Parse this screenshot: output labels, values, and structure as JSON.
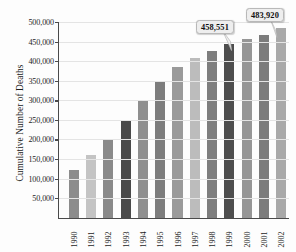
{
  "chart_data": {
    "type": "bar",
    "title": "",
    "subtitle": "",
    "xlabel": "",
    "ylabel": "Cumulative Number of Deaths",
    "categories": [
      "1990",
      "1991",
      "1992",
      "1993",
      "1994",
      "1995",
      "1996",
      "1997",
      "1998",
      "1999",
      "2000",
      "2001",
      "2002"
    ],
    "values": [
      122000,
      160000,
      201000,
      247000,
      298000,
      348000,
      386000,
      409000,
      427000,
      443000,
      457000,
      466000,
      484000
    ],
    "bar_colors": [
      "#8c8c8c",
      "#c4c4c4",
      "#8a8a8a",
      "#4a4a4a",
      "#8f8f8f",
      "#7d7d7d",
      "#9a9a9a",
      "#bcbcbc",
      "#7e7e7e",
      "#4e4e4e",
      "#969696",
      "#7c7c7c",
      "#a9a9a9"
    ],
    "ylim": [
      0,
      500000
    ],
    "y_ticks": [
      50000,
      100000,
      150000,
      200000,
      250000,
      300000,
      350000,
      400000,
      450000,
      500000
    ],
    "y_tick_labels": [
      "50,000",
      "100,000",
      "150,000",
      "200,000",
      "250,000",
      "300,000",
      "350,000",
      "400,000",
      "450,000",
      "500,000"
    ],
    "grid": true,
    "grid_axis": "y",
    "legend": false,
    "legend_position": "none",
    "annotations": [
      {
        "label": "458,551",
        "category": "1999",
        "value": 458551
      },
      {
        "label": "483,920",
        "category": "2002",
        "value": 483920
      }
    ]
  },
  "axis": {
    "y_title": "Cumulative Number of Deaths",
    "axis_color": "#4a4a4a",
    "grid_color": "#e4e4e4"
  },
  "callouts": [
    {
      "text": "458,551"
    },
    {
      "text": "483,920"
    }
  ]
}
